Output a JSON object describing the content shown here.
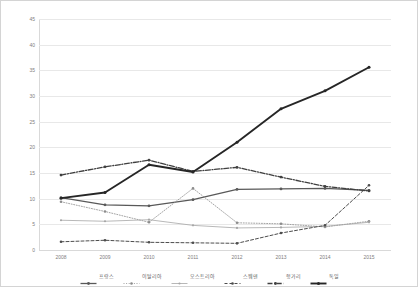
{
  "chart_data": {
    "type": "line",
    "title": "",
    "xlabel": "",
    "ylabel": "",
    "categories": [
      "2008",
      "2009",
      "2010",
      "2011",
      "2012",
      "2013",
      "2014",
      "2015"
    ],
    "ylim": [
      0,
      45
    ],
    "yticks": [
      "0",
      "5",
      "10",
      "15",
      "20",
      "25",
      "30",
      "35",
      "40",
      "45"
    ],
    "grid": true,
    "legend_position": "bottom",
    "series": [
      {
        "name": "프랑스",
        "style": "solid-marker",
        "color": "#595959",
        "values": [
          10.2,
          8.8,
          8.6,
          9.8,
          11.8,
          11.9,
          12.0,
          11.6
        ]
      },
      {
        "name": "이탈리아",
        "style": "dotted-marker",
        "color": "#8c8c8c",
        "values": [
          9.4,
          7.5,
          5.4,
          12.0,
          5.3,
          5.1,
          4.5,
          5.6
        ]
      },
      {
        "name": "오스트리아",
        "style": "thin-solid",
        "color": "#a6a6a6",
        "values": [
          5.8,
          5.6,
          5.9,
          4.8,
          4.3,
          4.4,
          4.6,
          5.4
        ]
      },
      {
        "name": "스웨덴",
        "style": "dashed-marker",
        "color": "#4d4d4d",
        "values": [
          1.6,
          1.9,
          1.5,
          1.4,
          1.3,
          3.3,
          4.8,
          12.6
        ]
      },
      {
        "name": "헝가리",
        "style": "dash-dot",
        "color": "#404040",
        "values": [
          14.6,
          16.2,
          17.5,
          15.3,
          16.1,
          14.2,
          12.4,
          11.5
        ]
      },
      {
        "name": "독일",
        "style": "thick-solid",
        "color": "#262626",
        "values": [
          10.1,
          11.2,
          16.6,
          15.2,
          21.0,
          27.5,
          31.0,
          35.6
        ]
      }
    ]
  }
}
